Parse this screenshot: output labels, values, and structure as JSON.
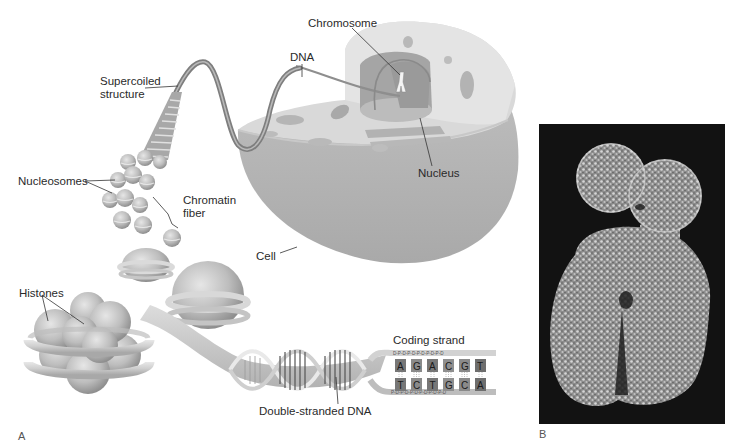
{
  "figure": {
    "panel_a": {
      "letter": "A",
      "labels": {
        "supercoiled": [
          "Supercoiled",
          "structure"
        ],
        "dna": "DNA",
        "chromosome": "Chromosome",
        "nucleus": "Nucleus",
        "cell": "Cell",
        "nucleosomes": "Nucleosomes",
        "chromatin_fiber": [
          "Chromatin",
          "fiber"
        ],
        "histones": "Histones",
        "coding_strand": "Coding strand",
        "double_stranded_dna": "Double-stranded DNA"
      },
      "coding_strand_bases": [
        "A",
        "G",
        "A",
        "C",
        "G",
        "T"
      ],
      "template_strand_bases": [
        "T",
        "C",
        "T",
        "G",
        "C",
        "A"
      ],
      "top_backbone": "D-P-D-P-D-P-D-P-D-P-D",
      "bottom_backbone": "P-D-P-D-P-D-P-D-P-D-P-D"
    },
    "panel_b": {
      "letter": "B",
      "description": "Scanning electron micrograph of a chromosome"
    }
  }
}
